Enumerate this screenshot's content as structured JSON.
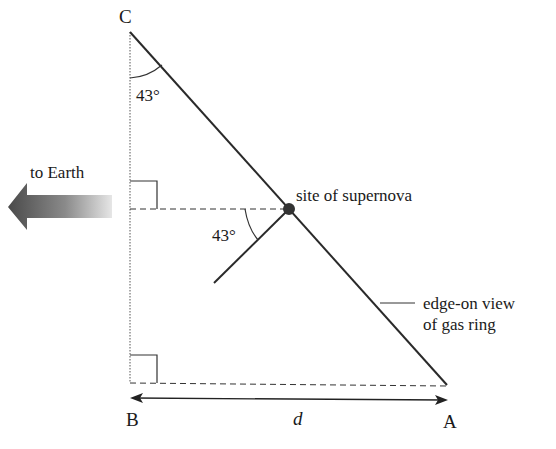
{
  "diagram": {
    "points": {
      "C": {
        "label": "C"
      },
      "B": {
        "label": "B"
      },
      "A": {
        "label": "A"
      }
    },
    "angle_top": "43°",
    "angle_mid": "43°",
    "direction_label": "to Earth",
    "supernova_label": "site of supernova",
    "ring_label_line1": "edge-on view",
    "ring_label_line2": "of gas ring",
    "distance_label": "d",
    "colors": {
      "line": "#2a2a2a",
      "dot": "#333333",
      "arrow_dark": "#555555",
      "arrow_light": "#e0e0e0"
    }
  }
}
